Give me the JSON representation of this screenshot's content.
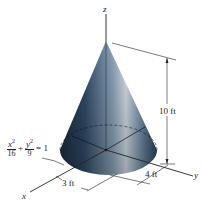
{
  "figure": {
    "type": "3D elliptical cone diagram",
    "axes": {
      "x_label": "x",
      "y_label": "y",
      "z_label": "z"
    },
    "equation": {
      "term1_num_var": "x",
      "term1_num_exp": "2",
      "term1_den": "16",
      "plus": "+",
      "term2_num_var": "y",
      "term2_num_exp": "2",
      "term2_den": "9",
      "rhs": "= 1"
    },
    "dimensions": {
      "height": "10 ft",
      "semi_axis_y": "4 ft",
      "semi_axis_x": "3 ft"
    },
    "colors": {
      "cone_dark": "#1c2f45",
      "cone_mid": "#4b6784",
      "cone_light": "#c9d6e2",
      "lines": "#222222"
    }
  }
}
